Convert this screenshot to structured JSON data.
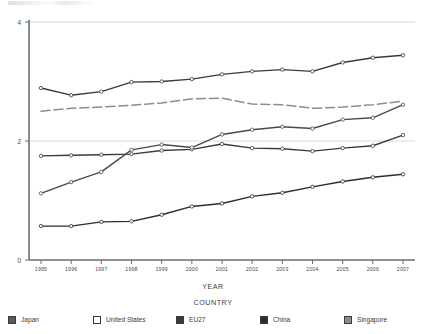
{
  "chart_data": {
    "type": "line",
    "title": "",
    "xlabel": "YEAR",
    "ylabel": "",
    "legend_title": "COUNTRY",
    "legend_position": "bottom",
    "grid": true,
    "ylim": [
      0,
      4
    ],
    "yticks": [
      "0",
      "2",
      "4"
    ],
    "ytick_values": [
      0,
      2,
      4
    ],
    "categories": [
      "1995",
      "1996",
      "1997",
      "1998",
      "1999",
      "2000",
      "2001",
      "2002",
      "2003",
      "2004",
      "2005",
      "2006",
      "2007"
    ],
    "x": [
      1995,
      1996,
      1997,
      1998,
      1999,
      2000,
      2001,
      2002,
      2003,
      2004,
      2005,
      2006,
      2007
    ],
    "series": [
      {
        "name": "Japan",
        "color": "#3a3a3a",
        "style": "solid",
        "marker": "circle-open",
        "values": [
          2.89,
          2.77,
          2.83,
          2.99,
          3.0,
          3.04,
          3.12,
          3.17,
          3.2,
          3.17,
          3.32,
          3.4,
          3.44
        ]
      },
      {
        "name": "United States",
        "color": "#8d8d8d",
        "style": "dashed",
        "marker": "none",
        "values": [
          2.5,
          2.55,
          2.57,
          2.6,
          2.64,
          2.71,
          2.72,
          2.62,
          2.61,
          2.55,
          2.57,
          2.61,
          2.67
        ]
      },
      {
        "name": "EU27",
        "color": "#3a3a3a",
        "style": "solid",
        "marker": "circle-open",
        "values": [
          1.75,
          1.76,
          1.77,
          1.78,
          1.84,
          1.86,
          1.95,
          1.88,
          1.87,
          1.83,
          1.88,
          1.92,
          2.1
        ]
      },
      {
        "name": "China",
        "color": "#2c2c2c",
        "style": "solid",
        "marker": "circle-open",
        "values": [
          0.57,
          0.57,
          0.64,
          0.65,
          0.76,
          0.9,
          0.95,
          1.07,
          1.13,
          1.23,
          1.32,
          1.39,
          1.44
        ]
      },
      {
        "name": "Singapore",
        "color": "#4a4a4a",
        "style": "solid",
        "marker": "circle-open",
        "values": [
          1.12,
          1.31,
          1.48,
          1.85,
          1.94,
          1.89,
          2.11,
          2.19,
          2.24,
          2.21,
          2.36,
          2.39,
          2.61
        ]
      }
    ],
    "legend_entries": [
      {
        "label": "Japan",
        "swatch": "#5a5a5a"
      },
      {
        "label": "United States",
        "swatch": "#ffffff"
      },
      {
        "label": "EU27",
        "swatch": "#3a3a3a"
      },
      {
        "label": "China",
        "swatch": "#2b2b2b"
      },
      {
        "label": "Singapore",
        "swatch": "#8a8a8a"
      }
    ]
  }
}
